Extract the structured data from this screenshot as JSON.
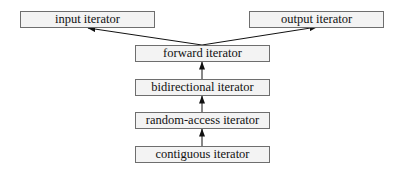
{
  "diagram": {
    "type": "hierarchy",
    "nodes": {
      "input": {
        "label": "input iterator"
      },
      "output": {
        "label": "output iterator"
      },
      "forward": {
        "label": "forward iterator"
      },
      "bidirectional": {
        "label": "bidirectional iterator"
      },
      "random_access": {
        "label": "random-access iterator"
      },
      "contiguous": {
        "label": "contiguous iterator"
      }
    },
    "edges": [
      {
        "from": "forward",
        "to": "input"
      },
      {
        "from": "forward",
        "to": "output"
      },
      {
        "from": "bidirectional",
        "to": "forward"
      },
      {
        "from": "random_access",
        "to": "bidirectional"
      },
      {
        "from": "contiguous",
        "to": "random_access"
      }
    ],
    "colors": {
      "node_fill": "#f3f3f3",
      "node_border": "#6e6e6e",
      "edge": "#111111"
    }
  }
}
